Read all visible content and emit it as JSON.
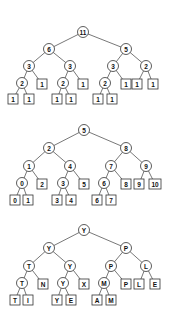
{
  "trees": [
    {
      "name": "count-tree",
      "nodes": [
        {
          "id": "r",
          "label": "11",
          "type": "circle",
          "x": 83,
          "y": 32
        },
        {
          "id": "a",
          "label": "6",
          "type": "circle",
          "x": 49,
          "y": 49,
          "parent": "r"
        },
        {
          "id": "b",
          "label": "5",
          "type": "circle",
          "x": 126,
          "y": 49,
          "parent": "r"
        },
        {
          "id": "aa",
          "label": "3",
          "type": "circle",
          "x": 29,
          "y": 66,
          "parent": "a"
        },
        {
          "id": "ab",
          "label": "3",
          "type": "circle",
          "x": 70,
          "y": 66,
          "parent": "a"
        },
        {
          "id": "ba",
          "label": "3",
          "type": "circle",
          "x": 113,
          "y": 66,
          "parent": "b"
        },
        {
          "id": "bb",
          "label": "2",
          "type": "circle",
          "x": 146,
          "y": 66,
          "parent": "b"
        },
        {
          "id": "aaa",
          "label": "2",
          "type": "circle",
          "x": 22,
          "y": 83,
          "parent": "aa"
        },
        {
          "id": "aab",
          "label": "1",
          "type": "box",
          "x": 42,
          "y": 84,
          "parent": "aa"
        },
        {
          "id": "aba",
          "label": "2",
          "type": "circle",
          "x": 63,
          "y": 83,
          "parent": "ab"
        },
        {
          "id": "abb",
          "label": "1",
          "type": "box",
          "x": 83,
          "y": 84,
          "parent": "ab"
        },
        {
          "id": "baa",
          "label": "2",
          "type": "circle",
          "x": 105,
          "y": 83,
          "parent": "ba"
        },
        {
          "id": "bab",
          "label": "1",
          "type": "box",
          "x": 126,
          "y": 84,
          "parent": "ba"
        },
        {
          "id": "bba",
          "label": "1",
          "type": "box",
          "x": 137,
          "y": 84,
          "parent": "bb"
        },
        {
          "id": "bbb",
          "label": "1",
          "type": "box",
          "x": 153,
          "y": 84,
          "parent": "bb"
        },
        {
          "id": "aaaa",
          "label": "1",
          "type": "box",
          "x": 13,
          "y": 99,
          "parent": "aaa"
        },
        {
          "id": "aaab",
          "label": "1",
          "type": "box",
          "x": 29,
          "y": 99,
          "parent": "aaa"
        },
        {
          "id": "abaa",
          "label": "1",
          "type": "box",
          "x": 57,
          "y": 99,
          "parent": "aba"
        },
        {
          "id": "abab",
          "label": "1",
          "type": "box",
          "x": 71,
          "y": 99,
          "parent": "aba"
        },
        {
          "id": "baaa",
          "label": "1",
          "type": "box",
          "x": 98,
          "y": 99,
          "parent": "baa"
        },
        {
          "id": "baab",
          "label": "1",
          "type": "box",
          "x": 112,
          "y": 99,
          "parent": "baa"
        }
      ]
    },
    {
      "name": "index-tree",
      "nodes": [
        {
          "id": "r",
          "label": "5",
          "type": "circle",
          "x": 84,
          "y": 130
        },
        {
          "id": "a",
          "label": "2",
          "type": "circle",
          "x": 49,
          "y": 148,
          "parent": "r"
        },
        {
          "id": "b",
          "label": "8",
          "type": "circle",
          "x": 126,
          "y": 148,
          "parent": "r"
        },
        {
          "id": "aa",
          "label": "1",
          "type": "circle",
          "x": 29,
          "y": 166,
          "parent": "a"
        },
        {
          "id": "ab",
          "label": "4",
          "type": "circle",
          "x": 70,
          "y": 166,
          "parent": "a"
        },
        {
          "id": "ba",
          "label": "7",
          "type": "circle",
          "x": 111,
          "y": 166,
          "parent": "b"
        },
        {
          "id": "bb",
          "label": "9",
          "type": "circle",
          "x": 146,
          "y": 166,
          "parent": "b"
        },
        {
          "id": "aaa",
          "label": "0",
          "type": "circle",
          "x": 22,
          "y": 183,
          "parent": "aa"
        },
        {
          "id": "aab",
          "label": "2",
          "type": "box",
          "x": 42,
          "y": 184,
          "parent": "aa"
        },
        {
          "id": "aba",
          "label": "3",
          "type": "circle",
          "x": 63,
          "y": 183,
          "parent": "ab"
        },
        {
          "id": "abb",
          "label": "5",
          "type": "box",
          "x": 84,
          "y": 184,
          "parent": "ab"
        },
        {
          "id": "baa",
          "label": "6",
          "type": "circle",
          "x": 104,
          "y": 183,
          "parent": "ba"
        },
        {
          "id": "bab",
          "label": "8",
          "type": "box",
          "x": 126,
          "y": 184,
          "parent": "ba"
        },
        {
          "id": "bba",
          "label": "9",
          "type": "box",
          "x": 139,
          "y": 184,
          "parent": "bb"
        },
        {
          "id": "bbb",
          "label": "10",
          "type": "box",
          "x": 155,
          "y": 184,
          "parent": "bb"
        },
        {
          "id": "aaaa",
          "label": "0",
          "type": "box",
          "x": 15,
          "y": 200,
          "parent": "aaa"
        },
        {
          "id": "aaab",
          "label": "1",
          "type": "box",
          "x": 28,
          "y": 200,
          "parent": "aaa"
        },
        {
          "id": "abaa",
          "label": "3",
          "type": "box",
          "x": 57,
          "y": 200,
          "parent": "aba"
        },
        {
          "id": "abab",
          "label": "4",
          "type": "box",
          "x": 71,
          "y": 200,
          "parent": "aba"
        },
        {
          "id": "baaa",
          "label": "6",
          "type": "box",
          "x": 97,
          "y": 200,
          "parent": "baa"
        },
        {
          "id": "baab",
          "label": "7",
          "type": "box",
          "x": 111,
          "y": 200,
          "parent": "baa"
        }
      ]
    },
    {
      "name": "letter-tree",
      "nodes": [
        {
          "id": "r",
          "label": "Y",
          "type": "circle",
          "x": 84,
          "y": 230
        },
        {
          "id": "a",
          "label": "Y",
          "type": "circle",
          "x": 49,
          "y": 248,
          "parent": "r"
        },
        {
          "id": "b",
          "label": "P",
          "type": "circle",
          "x": 126,
          "y": 248,
          "parent": "r"
        },
        {
          "id": "aa",
          "label": "T",
          "type": "circle",
          "x": 29,
          "y": 266,
          "parent": "a"
        },
        {
          "id": "ab",
          "label": "Y",
          "type": "circle",
          "x": 70,
          "y": 266,
          "parent": "a"
        },
        {
          "id": "ba",
          "label": "P",
          "type": "circle",
          "x": 111,
          "y": 266,
          "parent": "b"
        },
        {
          "id": "bb",
          "label": "L",
          "type": "circle",
          "x": 146,
          "y": 266,
          "parent": "b"
        },
        {
          "id": "aaa",
          "label": "T",
          "type": "circle",
          "x": 22,
          "y": 283,
          "parent": "aa"
        },
        {
          "id": "aab",
          "label": "N",
          "type": "box",
          "x": 43,
          "y": 284,
          "parent": "aa"
        },
        {
          "id": "aba",
          "label": "Y",
          "type": "circle",
          "x": 63,
          "y": 283,
          "parent": "ab"
        },
        {
          "id": "abb",
          "label": "X",
          "type": "box",
          "x": 84,
          "y": 284,
          "parent": "ab"
        },
        {
          "id": "baa",
          "label": "M",
          "type": "circle",
          "x": 104,
          "y": 283,
          "parent": "ba"
        },
        {
          "id": "bab",
          "label": "P",
          "type": "box",
          "x": 126,
          "y": 284,
          "parent": "ba"
        },
        {
          "id": "bba",
          "label": "L",
          "type": "box",
          "x": 139,
          "y": 284,
          "parent": "bb"
        },
        {
          "id": "bbb",
          "label": "E",
          "type": "box",
          "x": 155,
          "y": 284,
          "parent": "bb"
        },
        {
          "id": "aaaa",
          "label": "T",
          "type": "box",
          "x": 15,
          "y": 300,
          "parent": "aaa"
        },
        {
          "id": "aaab",
          "label": "I",
          "type": "box",
          "x": 28,
          "y": 300,
          "parent": "aaa"
        },
        {
          "id": "abaa",
          "label": "Y",
          "type": "box",
          "x": 57,
          "y": 300,
          "parent": "aba"
        },
        {
          "id": "abab",
          "label": "E",
          "type": "box",
          "x": 71,
          "y": 300,
          "parent": "aba"
        },
        {
          "id": "baaa",
          "label": "A",
          "type": "box",
          "x": 97,
          "y": 300,
          "parent": "baa"
        },
        {
          "id": "baab",
          "label": "M",
          "type": "box",
          "x": 111,
          "y": 300,
          "parent": "baa"
        }
      ]
    }
  ]
}
